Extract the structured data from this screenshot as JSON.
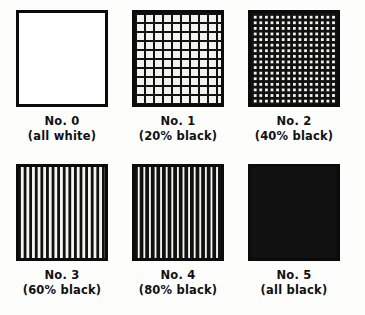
{
  "figure": {
    "background_color": "#fdfdfc",
    "ink_color": "#111111",
    "paper_color": "#ffffff",
    "columns": 3,
    "rows": 2
  },
  "patches": [
    {
      "index": 0,
      "name": "No. 0",
      "description": "(all white)",
      "coverage_percent": 0,
      "pattern": "solid-white",
      "fill_color": "#ffffff"
    },
    {
      "index": 1,
      "name": "No. 1",
      "description": "(20% black)",
      "coverage_percent": 20,
      "pattern": "grid-thin-rules",
      "fill_color": "#ffffff"
    },
    {
      "index": 2,
      "name": "No. 2",
      "description": "(40% black)",
      "coverage_percent": 40,
      "pattern": "grid-medium-rules",
      "fill_color": "#ffffff"
    },
    {
      "index": 3,
      "name": "No. 3",
      "description": "(60% black)",
      "coverage_percent": 60,
      "pattern": "black-field-white-squares",
      "fill_color": "#111111"
    },
    {
      "index": 4,
      "name": "No. 4",
      "description": "(80% black)",
      "coverage_percent": 80,
      "pattern": "black-field-white-pinholes",
      "fill_color": "#111111"
    },
    {
      "index": 5,
      "name": "No. 5",
      "description": "(all black)",
      "coverage_percent": 100,
      "pattern": "solid-black",
      "fill_color": "#111111"
    }
  ]
}
